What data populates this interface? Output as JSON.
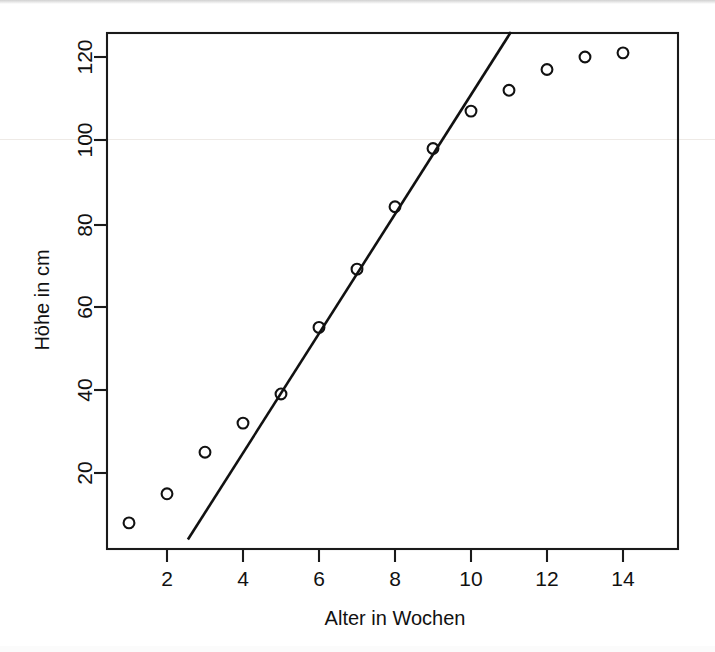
{
  "figure": {
    "kind": "scatter-plot-with-fitted-line",
    "background_color": "#ffffff",
    "foreground_color": "#111111"
  },
  "axes": {
    "x_title": "Alter in Wochen",
    "y_title": "Höhe in cm",
    "x_ticks": [
      "2",
      "4",
      "6",
      "8",
      "10",
      "12",
      "14"
    ],
    "y_ticks": [
      "20",
      "40",
      "60",
      "80",
      "100",
      "120"
    ]
  },
  "chart_data": {
    "type": "scatter",
    "title": "",
    "subtitle": "",
    "xlabel": "Alter in Wochen",
    "ylabel": "Höhe in cm",
    "xlim": [
      0.5,
      14.5
    ],
    "ylim": [
      4,
      126
    ],
    "xticks": [
      2,
      4,
      6,
      8,
      10,
      12,
      14
    ],
    "yticks": [
      20,
      40,
      60,
      80,
      100,
      120
    ],
    "grid": false,
    "legend": null,
    "legend_position": "none",
    "marker": "open-circle",
    "x": [
      1,
      2,
      3,
      4,
      5,
      6,
      7,
      8,
      9,
      10,
      11,
      12,
      13,
      14
    ],
    "series": [
      {
        "name": "Höhe in cm",
        "values": [
          8,
          15,
          25,
          32,
          39,
          55,
          69,
          84,
          98,
          107,
          112,
          117,
          120,
          121
        ]
      }
    ],
    "annotations": [],
    "fit_line": {
      "name": "Regressionsgerade (linearer Bereich)",
      "type": "line",
      "x_start": 2.55,
      "y_start": 4,
      "x_end": 11.05,
      "y_end": 126,
      "slope": 14.35,
      "intercept": -32.6
    }
  }
}
